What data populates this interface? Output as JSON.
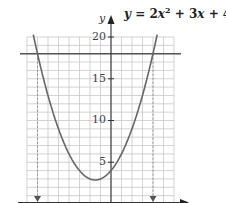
{
  "chart_data": {
    "type": "line",
    "equation": {
      "y": "y",
      "eq": "=",
      "a": "2",
      "x": "x",
      "exp": "2",
      "b_part": "+ 3",
      "c_part": "+ 4"
    },
    "xlabel": "",
    "ylabel": "y",
    "xlim": [
      -4,
      3
    ],
    "ylim": [
      0,
      20
    ],
    "grid": true,
    "grid_x_step": 0.5,
    "grid_y_step": 1,
    "yticks": [
      5,
      10,
      15,
      20
    ],
    "ytick_labels": [
      "5",
      "10",
      "15",
      "20"
    ],
    "series": [
      {
        "name": "y = 2x^2 + 3x + 4",
        "kind": "parabola",
        "coefficients": {
          "a": 2,
          "b": 3,
          "c": 4
        },
        "x": [
          -4,
          -3.5,
          -3,
          -2.5,
          -2,
          -1.5,
          -1,
          -0.75,
          -0.5,
          0,
          0.5,
          1,
          1.5,
          2,
          2.5
        ],
        "y": [
          24,
          18,
          13,
          9,
          6,
          4,
          3,
          2.875,
          3,
          4,
          6,
          9,
          13,
          18,
          24
        ]
      },
      {
        "name": "y = 18",
        "kind": "horizontal_line",
        "y_value": 18
      }
    ],
    "annotations": [
      {
        "type": "dashed_arrow_down",
        "x": -3.5,
        "from_y": 18,
        "to_y": 0
      },
      {
        "type": "dashed_arrow_down",
        "x": 2,
        "from_y": 18,
        "to_y": 0
      }
    ],
    "vertex": {
      "x": -0.75,
      "y": 2.875
    },
    "y_intercept": 4
  }
}
